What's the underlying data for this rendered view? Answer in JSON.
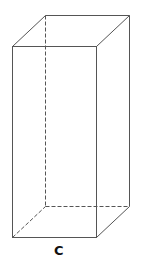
{
  "diagram": {
    "type": "rectangular-prism",
    "label": "C",
    "colors": {
      "edge": "#555555",
      "label": "#111111",
      "background": "#ffffff"
    }
  }
}
